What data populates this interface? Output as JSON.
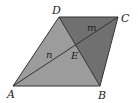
{
  "diagram": {
    "type": "parallelogram-with-diagonals",
    "points": {
      "A": {
        "x": 13,
        "y": 86
      },
      "B": {
        "x": 100,
        "y": 86
      },
      "C": {
        "x": 118,
        "y": 17
      },
      "D": {
        "x": 59,
        "y": 17
      },
      "E": {
        "x": 76,
        "y": 45
      }
    },
    "vertex_labels": {
      "A": {
        "text": "A",
        "x": 7,
        "y": 98
      },
      "B": {
        "text": "B",
        "x": 98,
        "y": 99
      },
      "C": {
        "text": "C",
        "x": 121,
        "y": 22
      },
      "D": {
        "text": "D",
        "x": 52,
        "y": 14
      },
      "E": {
        "text": "E",
        "x": 71,
        "y": 59
      }
    },
    "region_labels": {
      "m": {
        "text": "m",
        "x": 87,
        "y": 31
      },
      "n": {
        "text": "n",
        "x": 46,
        "y": 58
      }
    },
    "colors": {
      "region_abd": "#9c9c9c",
      "region_dbc": "#707070",
      "stroke": "#333333"
    }
  }
}
